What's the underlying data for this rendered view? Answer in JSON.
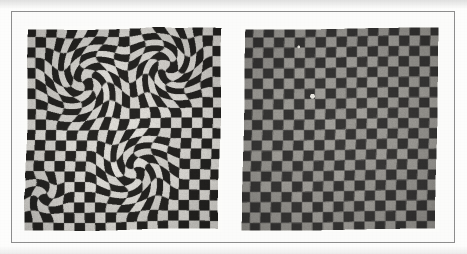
{
  "figure": {
    "frame_border_color": "#8d8d8d",
    "page_background": "#ffffff",
    "panels": [
      {
        "id": "distorted-checkerboard",
        "name": "left-checkerboard-image",
        "caption_text": "",
        "square_light_color": "#d9d7d2",
        "square_dark_color": "#262523",
        "contrast": "high",
        "cols": 19,
        "rows": 20,
        "distortion_type": "swirl",
        "swirls": [
          {
            "cx": 0.31,
            "cy": 0.27,
            "radius": 0.27,
            "strength": 2.45
          },
          {
            "cx": 0.72,
            "cy": 0.2,
            "radius": 0.24,
            "strength": -2.6
          },
          {
            "cx": 0.56,
            "cy": 0.7,
            "radius": 0.25,
            "strength": 2.3
          },
          {
            "cx": 0.1,
            "cy": 0.82,
            "radius": 0.14,
            "strength": -1.6
          }
        ],
        "edge_wave_amplitude": 0.35
      },
      {
        "id": "corrected-checkerboard",
        "name": "right-checkerboard-image",
        "caption_text": "",
        "square_light_color": "#9d9b96",
        "square_dark_color": "#383736",
        "contrast": "low",
        "cols": 19,
        "rows": 20,
        "distortion_type": "none",
        "swirls": [],
        "edge_wave_amplitude": 0.14,
        "blemishes": [
          {
            "x": 0.36,
            "y": 0.34,
            "r": 0.012,
            "color": "#e8e6e0"
          },
          {
            "x": 0.29,
            "y": 0.1,
            "r": 0.007,
            "color": "#e2e0da"
          }
        ]
      }
    ]
  }
}
